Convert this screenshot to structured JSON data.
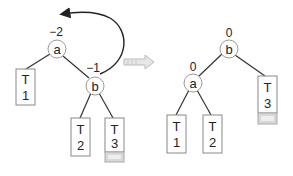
{
  "diagram": {
    "colors": {
      "edge": "#333333",
      "box": "#888888",
      "shade": "#d8d8d8",
      "arrow": "#cccccc"
    },
    "before": {
      "nodes": [
        {
          "id": "a",
          "label": "a",
          "balance": "−2"
        },
        {
          "id": "b",
          "label": "b",
          "balance": "−1"
        }
      ],
      "subtrees": [
        {
          "id": "T1",
          "line1": "T",
          "line2": "1"
        },
        {
          "id": "T2",
          "line1": "T",
          "line2": "2"
        },
        {
          "id": "T3",
          "line1": "T",
          "line2": "3",
          "extended": true
        }
      ]
    },
    "after": {
      "nodes": [
        {
          "id": "b",
          "label": "b",
          "balance": "0"
        },
        {
          "id": "a",
          "label": "a",
          "balance": "0"
        }
      ],
      "subtrees": [
        {
          "id": "T1",
          "line1": "T",
          "line2": "1"
        },
        {
          "id": "T2",
          "line1": "T",
          "line2": "2"
        },
        {
          "id": "T3",
          "line1": "T",
          "line2": "3",
          "extended": true
        }
      ]
    },
    "transition_arrow": "right-arrow-icon",
    "rotation_arrow": "curved-arrow-icon"
  }
}
